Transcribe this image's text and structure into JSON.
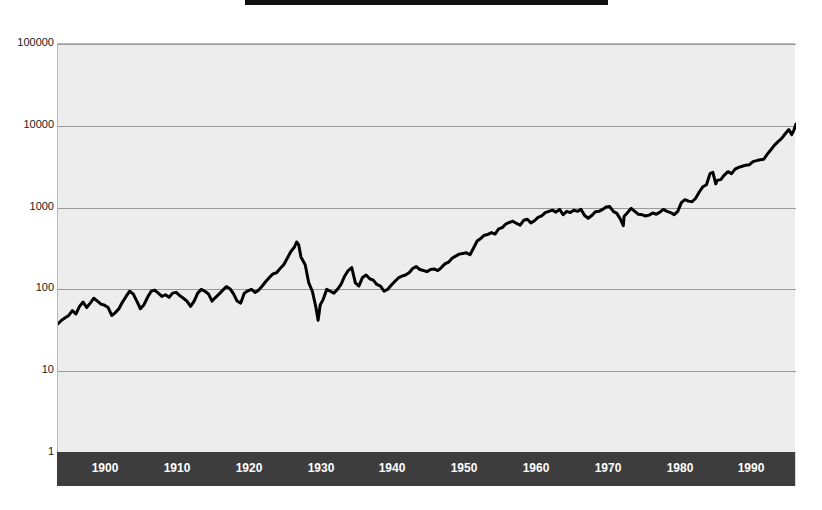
{
  "figure": {
    "title": "Stock Market Index 1896-1999",
    "background_color": "#ffffff",
    "plot_background_color": "#ededed",
    "axis_band_color": "#3d3d3d",
    "line_color": "#000000",
    "gridline_color": "#9a9a9a"
  },
  "chart_data": {
    "type": "line",
    "title": "Stock Market Index 1896-1999",
    "xlabel": "",
    "ylabel": "",
    "yscale": "log",
    "xscale": "linear",
    "grid": true,
    "legend_position": "none",
    "xlim": [
      1896,
      1999
    ],
    "ylim": [
      1,
      100000
    ],
    "yticks": [
      1,
      10,
      100,
      1000,
      10000,
      100000
    ],
    "ytick_labels": [
      "1",
      "10",
      "100",
      "1000",
      "10000",
      "100000"
    ],
    "xticks": [
      1900,
      1910,
      1920,
      1930,
      1940,
      1950,
      1960,
      1970,
      1980,
      1990
    ],
    "xtick_labels": [
      "1900",
      "1910",
      "1920",
      "1930",
      "1940",
      "1950",
      "1960",
      "1970",
      "1980",
      "1990"
    ],
    "series": [
      {
        "name": "Index level",
        "color": "#000000",
        "x": [
          1896.0,
          1896.5,
          1897.0,
          1897.5,
          1898.0,
          1898.5,
          1899.0,
          1899.5,
          1900.0,
          1900.5,
          1901.0,
          1901.5,
          1902.0,
          1902.5,
          1903.0,
          1903.5,
          1904.0,
          1904.5,
          1905.0,
          1905.5,
          1906.0,
          1906.5,
          1907.0,
          1907.5,
          1908.0,
          1908.5,
          1909.0,
          1909.5,
          1910.0,
          1910.5,
          1911.0,
          1911.5,
          1912.0,
          1912.5,
          1913.0,
          1913.5,
          1914.0,
          1914.5,
          1915.0,
          1915.5,
          1916.0,
          1916.5,
          1917.0,
          1917.5,
          1918.0,
          1918.5,
          1919.0,
          1919.5,
          1920.0,
          1920.5,
          1921.0,
          1921.5,
          1922.0,
          1922.5,
          1923.0,
          1923.5,
          1924.0,
          1924.5,
          1925.0,
          1925.5,
          1926.0,
          1926.5,
          1927.0,
          1927.5,
          1928.0,
          1928.5,
          1929.0,
          1929.3,
          1929.6,
          1929.9,
          1930.0,
          1930.5,
          1931.0,
          1931.5,
          1932.0,
          1932.3,
          1932.6,
          1933.0,
          1933.5,
          1934.0,
          1934.5,
          1935.0,
          1935.5,
          1936.0,
          1936.5,
          1937.0,
          1937.5,
          1938.0,
          1938.5,
          1939.0,
          1939.5,
          1940.0,
          1940.5,
          1941.0,
          1941.5,
          1942.0,
          1942.5,
          1943.0,
          1943.5,
          1944.0,
          1944.5,
          1945.0,
          1945.5,
          1946.0,
          1946.5,
          1947.0,
          1947.5,
          1948.0,
          1948.5,
          1949.0,
          1949.5,
          1950.0,
          1950.5,
          1951.0,
          1951.5,
          1952.0,
          1952.5,
          1953.0,
          1953.5,
          1954.0,
          1954.5,
          1955.0,
          1955.5,
          1956.0,
          1956.5,
          1957.0,
          1957.5,
          1958.0,
          1958.5,
          1959.0,
          1959.5,
          1960.0,
          1960.5,
          1961.0,
          1961.5,
          1962.0,
          1962.5,
          1963.0,
          1963.5,
          1964.0,
          1964.5,
          1965.0,
          1965.5,
          1966.0,
          1966.5,
          1967.0,
          1967.5,
          1968.0,
          1968.5,
          1969.0,
          1969.5,
          1970.0,
          1970.5,
          1971.0,
          1971.5,
          1972.0,
          1972.5,
          1973.0,
          1973.5,
          1974.0,
          1974.5,
          1974.9,
          1975.0,
          1975.5,
          1976.0,
          1976.5,
          1977.0,
          1977.5,
          1978.0,
          1978.5,
          1979.0,
          1979.5,
          1980.0,
          1980.5,
          1981.0,
          1981.5,
          1982.0,
          1982.5,
          1983.0,
          1983.5,
          1984.0,
          1984.5,
          1985.0,
          1985.5,
          1986.0,
          1986.5,
          1987.0,
          1987.4,
          1987.8,
          1988.0,
          1988.5,
          1989.0,
          1989.5,
          1990.0,
          1990.5,
          1991.0,
          1991.5,
          1992.0,
          1992.5,
          1993.0,
          1993.5,
          1994.0,
          1994.5,
          1995.0,
          1995.5,
          1996.0,
          1996.5,
          1997.0,
          1997.5,
          1998.0,
          1998.4,
          1998.7,
          1999.0
        ],
        "y": [
          38,
          42,
          45,
          48,
          55,
          50,
          62,
          70,
          60,
          68,
          78,
          72,
          66,
          64,
          60,
          48,
          52,
          58,
          70,
          82,
          95,
          88,
          72,
          58,
          65,
          80,
          95,
          98,
          90,
          82,
          86,
          80,
          90,
          92,
          84,
          78,
          72,
          62,
          72,
          90,
          100,
          95,
          88,
          72,
          80,
          88,
          98,
          108,
          102,
          88,
          72,
          68,
          90,
          96,
          100,
          92,
          98,
          110,
          125,
          140,
          155,
          160,
          180,
          200,
          240,
          290,
          330,
          380,
          350,
          250,
          240,
          200,
          120,
          95,
          60,
          42,
          65,
          75,
          100,
          95,
          90,
          100,
          115,
          145,
          170,
          185,
          120,
          110,
          140,
          150,
          135,
          130,
          115,
          110,
          95,
          100,
          112,
          125,
          138,
          145,
          150,
          160,
          180,
          190,
          175,
          170,
          165,
          175,
          178,
          170,
          185,
          205,
          215,
          240,
          255,
          270,
          275,
          280,
          265,
          320,
          390,
          420,
          460,
          470,
          495,
          475,
          550,
          570,
          630,
          660,
          680,
          640,
          610,
          700,
          720,
          650,
          690,
          760,
          790,
          870,
          900,
          930,
          880,
          950,
          820,
          900,
          870,
          930,
          900,
          950,
          800,
          740,
          800,
          890,
          900,
          950,
          1020,
          1030,
          900,
          850,
          720,
          600,
          780,
          870,
          980,
          900,
          830,
          820,
          790,
          810,
          860,
          830,
          880,
          950,
          900,
          870,
          820,
          900,
          1150,
          1250,
          1200,
          1180,
          1300,
          1550,
          1800,
          1900,
          2600,
          2700,
          1950,
          2150,
          2200,
          2500,
          2750,
          2600,
          2950,
          3100,
          3200,
          3300,
          3350,
          3650,
          3750,
          3850,
          3900,
          4500,
          5100,
          5800,
          6400,
          7000,
          8000,
          9000,
          7800,
          8800,
          10500
        ]
      }
    ]
  },
  "y_axis": {
    "labels": [
      {
        "value": "100000",
        "top": 37
      },
      {
        "value": "10000",
        "top": 119
      },
      {
        "value": "1000",
        "top": 201
      },
      {
        "value": "100",
        "top": 282
      },
      {
        "value": "10",
        "top": 364
      },
      {
        "value": "1",
        "top": 446
      }
    ]
  },
  "x_axis": {
    "labels": [
      {
        "value": "1900",
        "left": 105
      },
      {
        "value": "1910",
        "left": 177
      },
      {
        "value": "1920",
        "left": 249
      },
      {
        "value": "1930",
        "left": 321
      },
      {
        "value": "1940",
        "left": 392
      },
      {
        "value": "1950",
        "left": 464
      },
      {
        "value": "1960",
        "left": 536
      },
      {
        "value": "1970",
        "left": 608
      },
      {
        "value": "1980",
        "left": 680
      },
      {
        "value": "1990",
        "left": 751
      }
    ]
  }
}
